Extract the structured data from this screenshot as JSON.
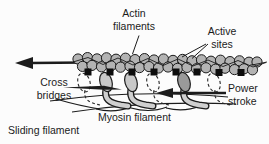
{
  "diagram": {
    "labels": {
      "actin_filaments": "Actin\nfilaments",
      "active_sites": "Active\nsites",
      "cross_bridges": "Cross\nbridges",
      "power_stroke": "Power\nstroke",
      "myosin_filament": "Myosin filament",
      "sliding_filament": "Sliding filament"
    },
    "icons": {
      "sliding_direction_arrow": "left-arrow",
      "power_stroke_arrow": "left-arrow",
      "active_site_marker": "black-square",
      "myosin_head_ghost": "dashed-outline"
    },
    "colors": {
      "background": "#fcfcfc",
      "outline": "#1c1c1c",
      "actin_bead_fill": "#b3b3b3",
      "myosin_head_fill": "#c8c8c8",
      "myosin_head_dark_fill": "#9a9a9a",
      "myosin_stalk_fill": "#cfcfcf",
      "active_site_fill": "#0d0d0d",
      "text": "#1b1b1b"
    }
  }
}
